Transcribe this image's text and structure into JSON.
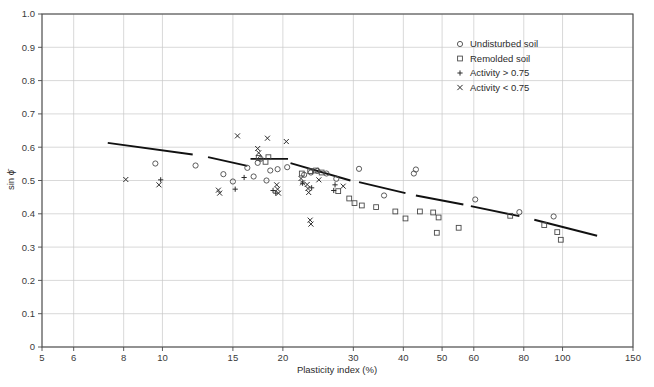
{
  "chart_data": {
    "type": "scatter",
    "title": "",
    "xlabel": "Plasticity index (%)",
    "ylabel": "sin ϕ̄",
    "x_scale": "log",
    "xlim": [
      5,
      150
    ],
    "ylim": [
      0,
      1.0
    ],
    "grid": true,
    "legend_position": "top-right",
    "x_ticks": [
      5,
      6,
      8,
      10,
      15,
      20,
      30,
      40,
      50,
      60,
      80,
      100,
      150
    ],
    "x_tick_labels": [
      "5",
      "6",
      "8",
      "10",
      "15",
      "20",
      "30",
      "40",
      "50",
      "60",
      "80",
      "100",
      "150"
    ],
    "y_ticks": [
      0,
      0.1,
      0.2,
      0.3,
      0.4,
      0.5,
      0.6,
      0.7,
      0.8,
      0.9,
      1.0
    ],
    "y_tick_labels": [
      "0",
      "0.1",
      "0.2",
      "0.3",
      "0.4",
      "0.5",
      "0.6",
      "0.7",
      "0.8",
      "0.9",
      "1.0"
    ],
    "legend": [
      {
        "marker": "circle",
        "label": "Undisturbed soil"
      },
      {
        "marker": "square",
        "label": "Remolded soil"
      },
      {
        "marker": "plus",
        "label": "Activity > 0.75"
      },
      {
        "marker": "cross",
        "label": "Activity < 0.75"
      }
    ],
    "series": [
      {
        "name": "Undisturbed soil",
        "marker": "circle",
        "points": [
          [
            9.6,
            0.551
          ],
          [
            12.1,
            0.545
          ],
          [
            14.2,
            0.519
          ],
          [
            15.0,
            0.497
          ],
          [
            16.3,
            0.538
          ],
          [
            16.9,
            0.512
          ],
          [
            17.3,
            0.553
          ],
          [
            17.6,
            0.565
          ],
          [
            18.2,
            0.5
          ],
          [
            18.6,
            0.53
          ],
          [
            19.4,
            0.534
          ],
          [
            20.5,
            0.54
          ],
          [
            22.6,
            0.517
          ],
          [
            23.5,
            0.524
          ],
          [
            24.4,
            0.529
          ],
          [
            25.7,
            0.521
          ],
          [
            27.2,
            0.505
          ],
          [
            31.0,
            0.535
          ],
          [
            35.8,
            0.455
          ],
          [
            42.5,
            0.521
          ],
          [
            43.0,
            0.533
          ],
          [
            60.5,
            0.443
          ],
          [
            78.0,
            0.405
          ],
          [
            95.0,
            0.392
          ]
        ]
      },
      {
        "name": "Remolded soil",
        "marker": "square",
        "points": [
          [
            17.4,
            0.568
          ],
          [
            18.1,
            0.556
          ],
          [
            18.4,
            0.57
          ],
          [
            22.3,
            0.521
          ],
          [
            23.4,
            0.528
          ],
          [
            24.2,
            0.53
          ],
          [
            25.0,
            0.524
          ],
          [
            27.5,
            0.468
          ],
          [
            29.3,
            0.446
          ],
          [
            30.2,
            0.432
          ],
          [
            31.5,
            0.425
          ],
          [
            34.2,
            0.42
          ],
          [
            38.2,
            0.407
          ],
          [
            40.5,
            0.386
          ],
          [
            44.0,
            0.407
          ],
          [
            47.5,
            0.404
          ],
          [
            49.0,
            0.389
          ],
          [
            48.5,
            0.343
          ],
          [
            55.0,
            0.358
          ],
          [
            74.0,
            0.394
          ],
          [
            90.0,
            0.366
          ],
          [
            97.0,
            0.345
          ],
          [
            99.0,
            0.322
          ]
        ]
      },
      {
        "name": "Activity > 0.75",
        "marker": "plus",
        "points": [
          [
            9.9,
            0.502
          ],
          [
            15.2,
            0.474
          ],
          [
            16.0,
            0.509
          ],
          [
            18.9,
            0.47
          ],
          [
            19.2,
            0.462
          ],
          [
            22.4,
            0.492
          ],
          [
            23.6,
            0.478
          ],
          [
            26.8,
            0.47
          ],
          [
            27.0,
            0.487
          ]
        ]
      },
      {
        "name": "Activity < 0.75",
        "marker": "cross",
        "points": [
          [
            8.1,
            0.503
          ],
          [
            9.8,
            0.487
          ],
          [
            13.8,
            0.471
          ],
          [
            13.9,
            0.462
          ],
          [
            15.4,
            0.634
          ],
          [
            17.3,
            0.596
          ],
          [
            17.4,
            0.583
          ],
          [
            18.3,
            0.627
          ],
          [
            19.3,
            0.487
          ],
          [
            19.4,
            0.474
          ],
          [
            19.5,
            0.462
          ],
          [
            20.4,
            0.617
          ],
          [
            22.2,
            0.506
          ],
          [
            22.4,
            0.493
          ],
          [
            23.0,
            0.488
          ],
          [
            23.1,
            0.476
          ],
          [
            23.2,
            0.464
          ],
          [
            23.4,
            0.381
          ],
          [
            23.5,
            0.369
          ],
          [
            24.6,
            0.502
          ],
          [
            28.3,
            0.483
          ]
        ]
      }
    ],
    "trend_segments": [
      {
        "x0": 7.3,
        "y0": 0.613,
        "x1": 11.9,
        "y1": 0.578
      },
      {
        "x0": 13.0,
        "y0": 0.57,
        "x1": 16.3,
        "y1": 0.544
      },
      {
        "x0": 16.6,
        "y0": 0.565,
        "x1": 20.6,
        "y1": 0.565
      },
      {
        "x0": 20.9,
        "y0": 0.552,
        "x1": 29.5,
        "y1": 0.5
      },
      {
        "x0": 31.0,
        "y0": 0.495,
        "x1": 40.5,
        "y1": 0.462
      },
      {
        "x0": 43.0,
        "y0": 0.455,
        "x1": 56.5,
        "y1": 0.428
      },
      {
        "x0": 59.0,
        "y0": 0.423,
        "x1": 78.0,
        "y1": 0.393
      },
      {
        "x0": 85.0,
        "y0": 0.382,
        "x1": 122.0,
        "y1": 0.334
      }
    ]
  }
}
